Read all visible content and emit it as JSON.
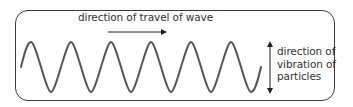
{
  "diagram": {
    "type": "transverse-wave",
    "travel_label": "direction of travel of wave",
    "vibration_label": {
      "lines": [
        "direction of",
        "vibration of",
        "particles"
      ]
    },
    "wave": {
      "cycles": 6,
      "color": "#555555",
      "stroke_width": 2
    },
    "arrows": {
      "travel": {
        "direction": "right",
        "color": "#222222"
      },
      "vibration": {
        "direction": "up-down",
        "color": "#222222"
      }
    },
    "frame_color": "#3a3a3a"
  }
}
